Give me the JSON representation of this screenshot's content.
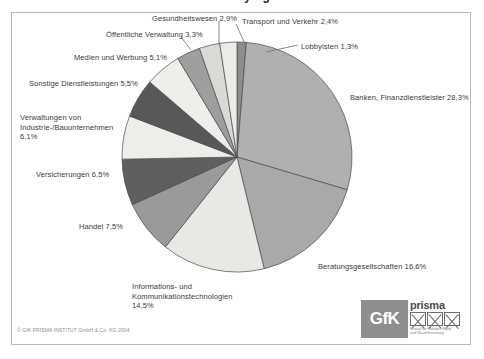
{
  "title_remnant": "Lobbying",
  "chart_data": {
    "type": "pie",
    "title": "",
    "legend": "labels-with-leader-lines",
    "unit": "%",
    "decimal_separator": ",",
    "start_angle_deg": 0,
    "direction": "clockwise",
    "categories": [
      "Lobbyisten",
      "Banken, Finanzdienstleister",
      "Beratungsgesellschaften",
      "Informations- und Kommunikationstechnologien",
      "Handel",
      "Versicherungen",
      "Verwaltungen von Industrie-/Bauunternehmen",
      "Sonstige Dienstleistungen",
      "Medien und Werbung",
      "Öffentliche Verwaltung",
      "Gesundheitswesen",
      "Transport und Verkehr"
    ],
    "values": [
      1.3,
      28.3,
      16.6,
      14.5,
      7.5,
      6.5,
      6.1,
      5.5,
      5.1,
      3.3,
      2.9,
      2.4
    ],
    "colors": [
      "#8d8d8d",
      "#b0b0b0",
      "#a9a9a9",
      "#e8e8e4",
      "#9a9a9a",
      "#5f5f5f",
      "#ededea",
      "#585858",
      "#eeeeea",
      "#9e9e9e",
      "#d9d9d6",
      "#ebebe7"
    ],
    "slice_outline": "#4a4a4a",
    "center": {
      "x": 237,
      "y": 157
    },
    "radius": {
      "rx": 115,
      "ry": 115
    }
  },
  "labels": [
    {
      "text": "Gesundheitswesen 2,9%",
      "x": 152,
      "y": 14,
      "align": "left",
      "width": 0
    },
    {
      "text": "Transport und Verkehr 2,4%",
      "x": 242,
      "y": 17,
      "align": "left",
      "width": 0
    },
    {
      "text": "Öffentliche Verwaltung 3,3%",
      "x": 106,
      "y": 30,
      "align": "left",
      "width": 0
    },
    {
      "text": "Lobbyisten 1,3%",
      "x": 301,
      "y": 42,
      "align": "left",
      "width": 0
    },
    {
      "text": "Medien und Werbung 5,1%",
      "x": 74,
      "y": 53,
      "align": "left",
      "width": 0
    },
    {
      "text": "Sonstige Dienstleistungen 5,5%",
      "x": 29,
      "y": 79,
      "align": "left",
      "width": 0
    },
    {
      "text": "Banken, Finanzdienstleister 28,3%",
      "x": 350,
      "y": 93,
      "align": "left",
      "width": 0
    },
    {
      "text": "Verwaltungen von Industrie-/Bauunternehmen 6,1%",
      "x": 20,
      "y": 113,
      "align": "left",
      "width": 112
    },
    {
      "text": "Versicherungen 6,5%",
      "x": 36,
      "y": 170,
      "align": "left",
      "width": 0
    },
    {
      "text": "Handel 7,5%",
      "x": 79,
      "y": 222,
      "align": "left",
      "width": 0
    },
    {
      "text": "Beratungsgesellschaften 16,6%",
      "x": 318,
      "y": 262,
      "align": "left",
      "width": 0
    },
    {
      "text": "Informations- und Kommunikationstechnologien 14,5%",
      "x": 132,
      "y": 282,
      "align": "left",
      "width": 118
    }
  ],
  "leader_lines": [
    {
      "x1": 219,
      "y1": 21,
      "x2": 219,
      "y2": 44
    },
    {
      "x1": 236,
      "y1": 24,
      "x2": 245,
      "y2": 44
    },
    {
      "x1": 181,
      "y1": 37,
      "x2": 191,
      "y2": 50
    },
    {
      "x1": 298,
      "y1": 45,
      "x2": 266,
      "y2": 52
    }
  ],
  "footer": {
    "copyright": "© GfK PRISMA INSTITUT GmbH & Co. KG 2004"
  },
  "logo": {
    "gfk": "GfK",
    "prisma": "prisma",
    "tagline_line1": "Institut für Handel, Stadt",
    "tagline_line2": "und Raumforschung"
  }
}
